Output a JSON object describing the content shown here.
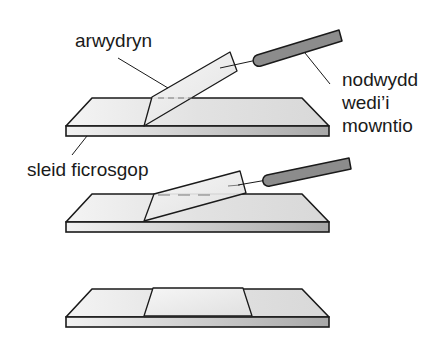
{
  "diagram": {
    "labels": {
      "coverslip": "arwydryn",
      "needle_line1": "nodwydd",
      "needle_line2": "wedi’i",
      "needle_line3": "mowntio",
      "slide": "sleid ficrosgop"
    },
    "steps": [
      {
        "name": "step-1",
        "description": "coverslip held at steep angle by mounted needle"
      },
      {
        "name": "step-2",
        "description": "coverslip lowered at shallow angle"
      },
      {
        "name": "step-3",
        "description": "coverslip lying flat on slide"
      }
    ],
    "colors": {
      "outline": "#1a1a1a",
      "slide_face": "#e4e4e4",
      "slide_edge": "#bdbdbd",
      "coverslip": "#f2f2f2",
      "needle_handle": "#8c8c8c"
    }
  }
}
